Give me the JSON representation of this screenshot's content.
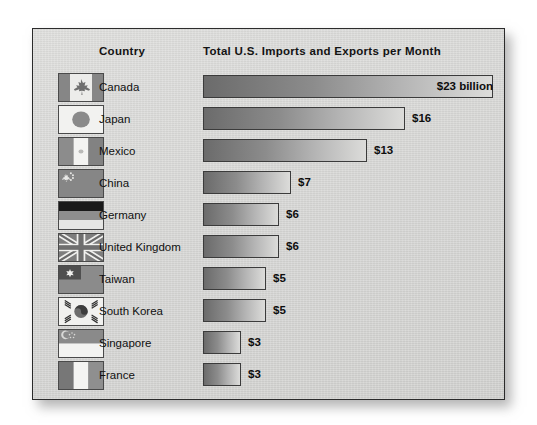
{
  "panel": {
    "background_color": "#d6d6d4",
    "border_color": "#2b2b2b"
  },
  "header": {
    "country_label": "Country",
    "metric_label": "Total U.S. Imports and Exports per Month"
  },
  "chart_data": {
    "type": "bar",
    "orientation": "horizontal",
    "title": "Total U.S. Imports and Exports per Month",
    "xlabel": "",
    "ylabel": "Country",
    "unit": "billion U.S. dollars per month",
    "categories": [
      "Canada",
      "Japan",
      "Mexico",
      "China",
      "Germany",
      "United Kingdom",
      "Taiwan",
      "South Korea",
      "Singapore",
      "France"
    ],
    "values": [
      23,
      16,
      13,
      7,
      6,
      6,
      5,
      5,
      3,
      3
    ],
    "value_labels": [
      "$23 billion",
      "$16",
      "$13",
      "$7",
      "$6",
      "$6",
      "$5",
      "$5",
      "$3",
      "$3"
    ],
    "label_placement": [
      "inside",
      "outside",
      "outside",
      "outside",
      "outside",
      "outside",
      "outside",
      "outside",
      "outside",
      "outside"
    ],
    "xlim": [
      0,
      23
    ],
    "grid": false,
    "legend": "none",
    "bar_gradient_from": "#6b6b6b",
    "bar_gradient_to": "#dcdcda",
    "bar_border_color": "#3b3b3b"
  },
  "rows": [
    {
      "country": "Canada",
      "flag": "flag-canada",
      "value": 23,
      "value_label": "$23 billion",
      "inside": true
    },
    {
      "country": "Japan",
      "flag": "flag-japan",
      "value": 16,
      "value_label": "$16",
      "inside": false
    },
    {
      "country": "Mexico",
      "flag": "flag-mexico",
      "value": 13,
      "value_label": "$13",
      "inside": false
    },
    {
      "country": "China",
      "flag": "flag-china",
      "value": 7,
      "value_label": "$7",
      "inside": false
    },
    {
      "country": "Germany",
      "flag": "flag-germany",
      "value": 6,
      "value_label": "$6",
      "inside": false
    },
    {
      "country": "United Kingdom",
      "flag": "flag-united-kingdom",
      "value": 6,
      "value_label": "$6",
      "inside": false
    },
    {
      "country": "Taiwan",
      "flag": "flag-taiwan",
      "value": 5,
      "value_label": "$5",
      "inside": false
    },
    {
      "country": "South Korea",
      "flag": "flag-south-korea",
      "value": 5,
      "value_label": "$5",
      "inside": false
    },
    {
      "country": "Singapore",
      "flag": "flag-singapore",
      "value": 3,
      "value_label": "$3",
      "inside": false
    },
    {
      "country": "France",
      "flag": "flag-france",
      "value": 3,
      "value_label": "$3",
      "inside": false
    }
  ]
}
